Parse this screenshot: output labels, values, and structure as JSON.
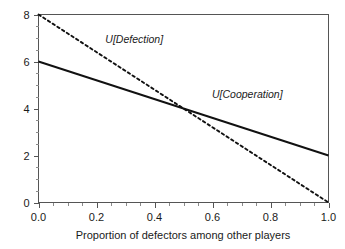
{
  "chart_data": {
    "type": "line",
    "title": "",
    "subtitle": "",
    "xlabel": "Proportion of defectors among other players",
    "ylabel": "",
    "xlim": [
      0.0,
      1.0
    ],
    "ylim": [
      0.0,
      8.0
    ],
    "grid": false,
    "legend_position": "inline-annotation",
    "x_ticks": [
      0.0,
      0.2,
      0.4,
      0.6,
      0.8,
      1.0
    ],
    "x_tick_labels": [
      "0.0",
      "0.2",
      "0.4",
      "0.6",
      "0.8",
      "1.0"
    ],
    "x_minor_tick_step": 0.05,
    "y_ticks": [
      0,
      2,
      4,
      6,
      8
    ],
    "y_tick_labels": [
      "0",
      "2",
      "4",
      "6",
      "8"
    ],
    "y_minor_tick_step": 0.5,
    "x": [
      0.0,
      1.0
    ],
    "series": [
      {
        "name": "U[Defection]",
        "style": "dashed",
        "color": "#111111",
        "values": [
          8.0,
          0.0
        ],
        "annotation": "U[Defection]",
        "annotation_x": 0.33,
        "annotation_y": 6.8
      },
      {
        "name": "U[Cooperation]",
        "style": "solid",
        "color": "#111111",
        "values": [
          6.0,
          2.0
        ],
        "annotation": "U[Cooperation]",
        "annotation_x": 0.72,
        "annotation_y": 4.45
      }
    ],
    "intersection": {
      "x": 0.5,
      "y": 4.0
    }
  },
  "colors": {
    "background": "#ffffff",
    "frame": "#555555",
    "text": "#1a1a1a",
    "line": "#111111"
  }
}
